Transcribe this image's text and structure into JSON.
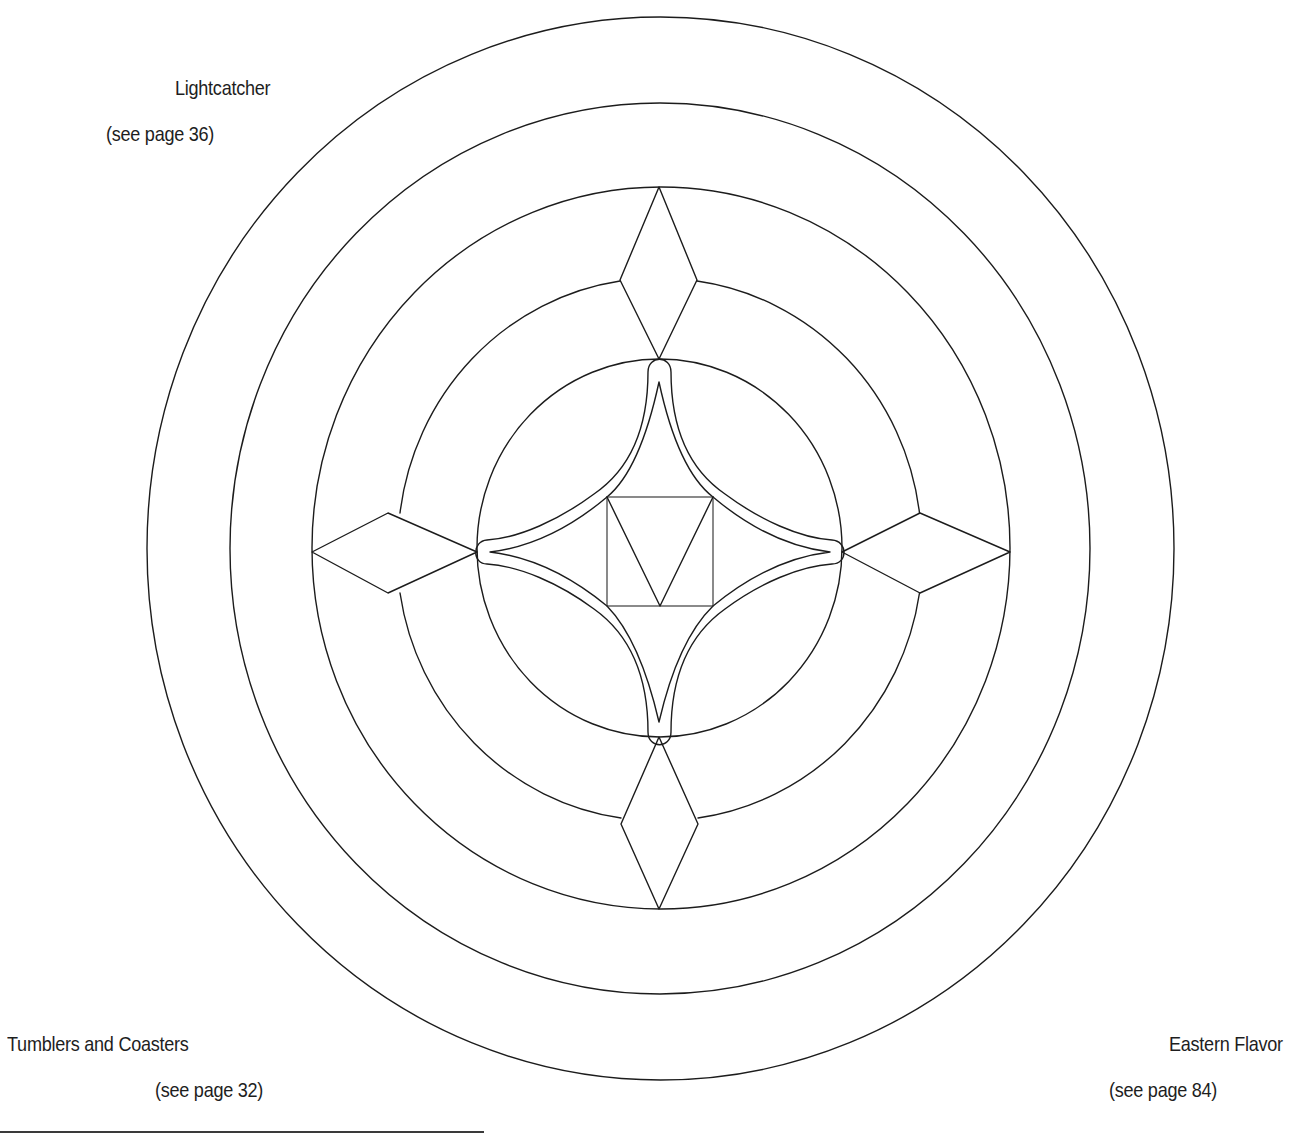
{
  "labels": {
    "top_left": {
      "title": "Lightcatcher",
      "page_ref": "(see page 36)"
    },
    "bottom_left": {
      "title": "Tumblers and Coasters",
      "page_ref": "(see page 32)"
    },
    "bottom_right": {
      "title": "Eastern Flavor",
      "page_ref": "(see page 84)"
    }
  },
  "pattern": {
    "description": "Concentric-ring stained glass pattern with four diamonds, a four-pointed curved star, and a central square with V",
    "stroke_color": "#1c1c1c",
    "background": "#ffffff",
    "rings": 5,
    "diamonds": 4
  }
}
